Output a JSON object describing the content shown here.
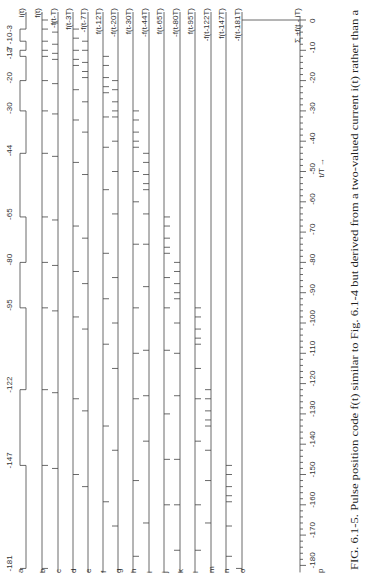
{
  "figure": {
    "caption_line1": "FIG. 6.1-5. Pulse position code f(t) similar to Fig. 6.1-4 but derived from a two-valued current i(t) rather than a",
    "caption_line2": "… the … T … … …",
    "axis_label": "t/T →",
    "sum_label": "Σ ±f(t - iT)",
    "row_letters": [
      "a",
      "b",
      "c",
      "d",
      "e",
      "f",
      "g",
      "h",
      "i",
      "j",
      "k",
      "l",
      "m",
      "n",
      "o",
      "p"
    ]
  },
  "chart_data": {
    "type": "pulse-position-diagram",
    "title": "Pulse position code f(t)",
    "xlabel": "t/T",
    "xlim": [
      -181,
      0
    ],
    "axis_ticks_labeled": [
      0,
      -10,
      -20,
      -30,
      -40,
      -50,
      -60,
      -70,
      -80,
      -90,
      -100,
      -110,
      -120,
      -130,
      -140,
      -150,
      -160,
      -170,
      -180
    ],
    "waveform_a": {
      "transition_labels": [
        "-3",
        "-10",
        "-3",
        "-7",
        "-12",
        "-20",
        "-30",
        "-44",
        "-65",
        "-80",
        "-95",
        "-122",
        "-147",
        "-181"
      ],
      "transitions": [
        0,
        -3,
        -10,
        -7,
        -12,
        -20,
        -30,
        -44,
        -65,
        -80,
        -95,
        -122,
        -147,
        -181
      ]
    },
    "series": [
      {
        "row": "b",
        "label": "f(t)",
        "shift": 0
      },
      {
        "row": "c",
        "label": "-f(t-T)",
        "shift": 1
      },
      {
        "row": "d",
        "label": "f(t-3T)",
        "shift": 3
      },
      {
        "row": "e",
        "label": "-f(t-7T)",
        "shift": 7
      },
      {
        "row": "f",
        "label": "f(t-12T)",
        "shift": 12
      },
      {
        "row": "g",
        "label": "-f(t-20T)",
        "shift": 20
      },
      {
        "row": "h",
        "label": "f(t-30T)",
        "shift": 30
      },
      {
        "row": "i",
        "label": "-f(t-44T)",
        "shift": 44
      },
      {
        "row": "j",
        "label": "f(t-65T)",
        "shift": 65
      },
      {
        "row": "k",
        "label": "-f(t-80T)",
        "shift": 80
      },
      {
        "row": "l",
        "label": "f(t-95T)",
        "shift": 95
      },
      {
        "row": "m",
        "label": "-f(t-122T)",
        "shift": 122
      },
      {
        "row": "n",
        "label": "f(t-147T)",
        "shift": 147
      },
      {
        "row": "o",
        "label": "-f(t-181T)",
        "shift": 181
      }
    ],
    "top_label_a": "i(t)",
    "sum_row": {
      "row": "p",
      "label": "Σ ±f(t - iT)",
      "pulse_at": 0
    },
    "pulse_times": [
      0,
      -3,
      -10,
      -7,
      -12,
      -20,
      -30,
      -44,
      -65,
      -80,
      -95,
      -122,
      -147,
      -181
    ]
  }
}
